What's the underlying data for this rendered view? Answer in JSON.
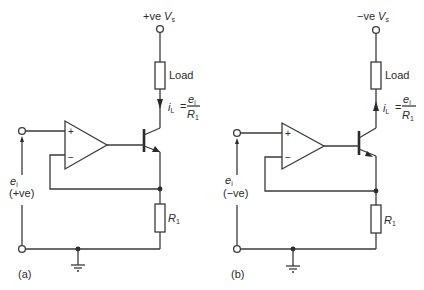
{
  "figure": {
    "panels": [
      {
        "id": "a",
        "caption": "(a)",
        "supply_label_prefix": "+ve ",
        "supply_symbol": "V",
        "supply_subscript": "s",
        "load_label": "Load",
        "current_symbol": "i",
        "current_subscript": "L",
        "equals": "=",
        "numerator_symbol": "e",
        "numerator_subscript": "i",
        "denominator_symbol": "R",
        "denominator_subscript": "1",
        "input_symbol": "e",
        "input_subscript": "i",
        "input_polarity": "(+ve)",
        "resistor_symbol": "R",
        "resistor_subscript": "1",
        "opamp_plus": "+",
        "opamp_minus": "−",
        "current_direction": "down",
        "transistor_type": "NPN"
      },
      {
        "id": "b",
        "caption": "(b)",
        "supply_label_prefix": "−ve ",
        "supply_symbol": "V",
        "supply_subscript": "s",
        "load_label": "Load",
        "current_symbol": "i",
        "current_subscript": "L",
        "equals": "=",
        "numerator_symbol": "e",
        "numerator_subscript": "i",
        "denominator_symbol": "R",
        "denominator_subscript": "1",
        "input_symbol": "e",
        "input_subscript": "i",
        "input_polarity": "(−ve)",
        "resistor_symbol": "R",
        "resistor_subscript": "1",
        "opamp_plus": "+",
        "opamp_minus": "−",
        "current_direction": "up",
        "transistor_type": "PNP"
      }
    ]
  }
}
